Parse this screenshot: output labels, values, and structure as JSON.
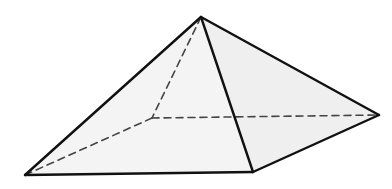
{
  "diagram": {
    "type": "square-pyramid",
    "vertices": {
      "apex": [
        201,
        17
      ],
      "front_left": [
        25,
        175
      ],
      "front_right": [
        253,
        172
      ],
      "right": [
        379,
        115
      ],
      "back_hidden": [
        152,
        118
      ]
    },
    "visible_edges": [
      [
        "apex",
        "front_left"
      ],
      [
        "apex",
        "front_right"
      ],
      [
        "apex",
        "right"
      ],
      [
        "front_left",
        "front_right"
      ],
      [
        "front_right",
        "right"
      ]
    ],
    "hidden_edges": [
      [
        "apex",
        "back_hidden"
      ],
      [
        "back_hidden",
        "front_left"
      ],
      [
        "back_hidden",
        "right"
      ]
    ],
    "colors": {
      "edge": "#111111",
      "hidden_edge": "#444444",
      "face_left": "#f4f4f4",
      "face_right": "#efefef",
      "background": "#ffffff"
    }
  }
}
